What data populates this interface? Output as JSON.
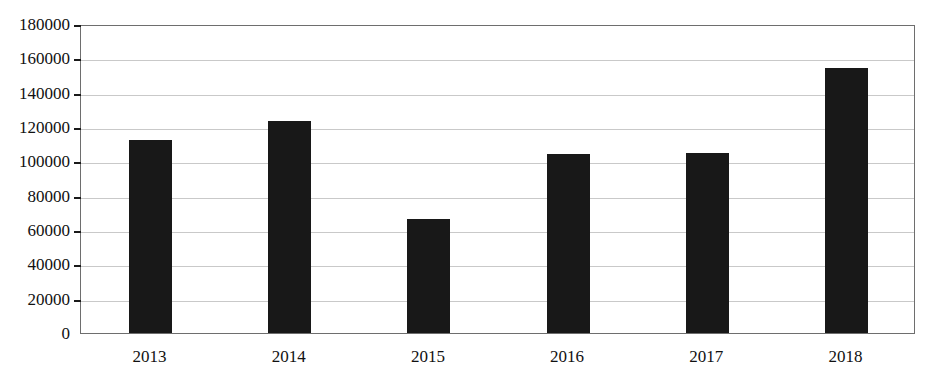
{
  "chart_data": {
    "type": "bar",
    "title": "",
    "subtitle": "",
    "xlabel": "",
    "ylabel": "",
    "categories": [
      "2013",
      "2014",
      "2015",
      "2016",
      "2017",
      "2018"
    ],
    "values": [
      112500,
      123500,
      66500,
      104000,
      105000,
      154500
    ],
    "series": [
      {
        "name": "",
        "values": [
          112500,
          123500,
          66500,
          104000,
          105000,
          154500
        ]
      }
    ],
    "ylim": [
      0,
      180000
    ],
    "ytick_values": [
      0,
      20000,
      40000,
      60000,
      80000,
      100000,
      120000,
      140000,
      160000,
      180000
    ],
    "ytick_labels": [
      "0",
      "20000",
      "40000",
      "60000",
      "80000",
      "100000",
      "120000",
      "140000",
      "160000",
      "180000"
    ],
    "grid": true,
    "grid_axis": "y",
    "legend": false,
    "legend_position": "none",
    "bar_color": "#181818",
    "grid_color": "#c9c9c9",
    "frame_color": "#6e6e6e",
    "background_color": "#ffffff",
    "annotations": []
  },
  "caption": {
    "text": ""
  }
}
